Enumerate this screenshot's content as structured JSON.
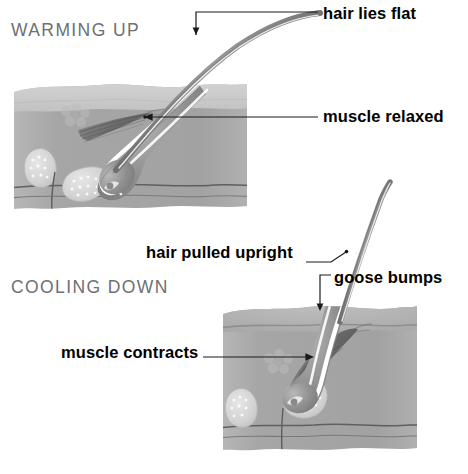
{
  "figure": {
    "width": 468,
    "height": 474,
    "background": "#ffffff",
    "topic": "skin cross-section showing hair and arrector pili muscle during warming up and cooling down"
  },
  "sections": {
    "warming": {
      "title": "WARMING UP",
      "color": "#6f7072"
    },
    "cooling": {
      "title": "COOLING DOWN",
      "color": "#6f7072"
    }
  },
  "callouts": {
    "hair_lies_flat": "hair lies flat",
    "muscle_relaxed": "muscle relaxed",
    "hair_pulled_upright": "hair pulled upright",
    "goose_bumps": "goose bumps",
    "muscle_contracts": "muscle contracts"
  },
  "palette": {
    "label_text": "#000000",
    "heading_text": "#6f7072",
    "leader_line": "#1a1a1a",
    "skin_epidermis": "#c9c9c9",
    "skin_dermis": "#a9a9a9",
    "skin_deep": "#9e9e9e",
    "hair_shaft": "#8d8d8d",
    "hair_highlight": "#ffffff",
    "follicle": "#8a8a8a",
    "gland": "#d7d7d7",
    "muscle": "#6d6d6d",
    "nerve": "#5a5a5a"
  }
}
